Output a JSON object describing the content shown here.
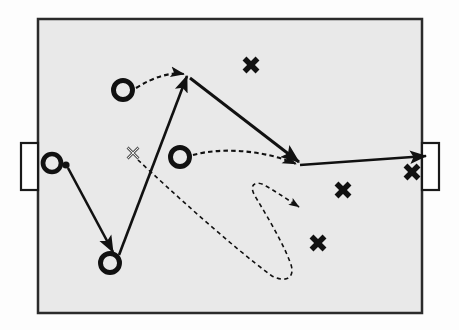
{
  "diagram": {
    "type": "sports-play-diagram",
    "colors": {
      "field_fill": "#e9e9e9",
      "field_border": "#2b2b2b",
      "outer_background": "#fdfdfd",
      "marker_stroke": "#111111",
      "run_path": "#111111",
      "pass_path": "#111111"
    },
    "field": {
      "label": "playing-field",
      "x": 38,
      "y": 19,
      "width": 384,
      "height": 294,
      "border_width": 2.5
    },
    "goals": [
      {
        "id": "goal-left",
        "label": "Left Goal",
        "x": 21,
        "y": 143,
        "width": 17,
        "height": 47
      },
      {
        "id": "goal-right",
        "label": "Right Goal",
        "x": 422,
        "y": 143,
        "width": 17,
        "height": 47
      }
    ],
    "markers": {
      "offense_label": "O",
      "defense_label": "X",
      "ball_label": "ball"
    },
    "players_offense": [
      {
        "id": "o-ball-carrier",
        "label": "O",
        "cx": 52,
        "cy": 163,
        "r": 9,
        "has_ball": true,
        "ball_cx": 66,
        "ball_cy": 165,
        "ball_r": 3.6
      },
      {
        "id": "o-top-left",
        "label": "O",
        "cx": 123,
        "cy": 90,
        "r": 9.5,
        "has_ball": false
      },
      {
        "id": "o-center",
        "label": "O",
        "cx": 180,
        "cy": 157,
        "r": 9.5,
        "has_ball": false
      },
      {
        "id": "o-bottom-left",
        "label": "O",
        "cx": 110,
        "cy": 263,
        "r": 9.5,
        "has_ball": false
      }
    ],
    "players_defense": [
      {
        "id": "x-top",
        "label": "X",
        "cx": 251,
        "cy": 65,
        "size": 13,
        "filled": true
      },
      {
        "id": "x-screen",
        "label": "X",
        "cx": 133,
        "cy": 153,
        "size": 11,
        "filled": false
      },
      {
        "id": "x-right-upper",
        "label": "X",
        "cx": 412,
        "cy": 172,
        "size": 13,
        "filled": true
      },
      {
        "id": "x-right-mid",
        "label": "X",
        "cx": 343,
        "cy": 190,
        "size": 13,
        "filled": true
      },
      {
        "id": "x-right-lower",
        "label": "X",
        "cx": 318,
        "cy": 243,
        "size": 13,
        "filled": true
      }
    ],
    "paths_solid": [
      {
        "id": "run-ballcarrier-to-bottomleft",
        "kind": "run",
        "description": "Ball carrier drives from left goal area down to bottom-left position",
        "d": "M 68 168 L 113 252",
        "arrowhead": true
      },
      {
        "id": "run-bottomleft-to-apex",
        "kind": "run",
        "description": "Bottom-left player runs up to the top apex point",
        "d": "M 119 255 L 187 76",
        "arrowhead": true
      },
      {
        "id": "run-apex-to-right",
        "kind": "run",
        "description": "From apex driving down-right to the right side convergence point",
        "d": "M 190 78 L 299 162",
        "arrowhead": true
      },
      {
        "id": "shot-to-right-goal",
        "kind": "shot",
        "description": "Shot from the right convergence point into the right goal",
        "d": "M 300 165 L 426 156",
        "arrowhead": true
      }
    ],
    "paths_dashed": [
      {
        "id": "pass-topleft-to-apex",
        "kind": "pass",
        "description": "Pass from top-left O curving right to the apex",
        "d": "M 136 88 C 155 76, 172 72, 184 74",
        "arrowhead": true
      },
      {
        "id": "pass-center-to-right",
        "kind": "pass",
        "description": "Pass from center O curving right to the convergence point",
        "d": "M 193 155 C 225 146, 270 152, 296 164",
        "arrowhead": true
      },
      {
        "id": "cut-screen-x-loop",
        "kind": "cut",
        "description": "Cut path from the hollow X looping around and back up to the right",
        "d": "M 138 160 C 170 190, 230 245, 272 276 C 288 284, 296 276, 290 262 C 282 240, 262 208, 255 196 C 248 184, 256 180, 266 186 C 278 193, 290 201, 299 207",
        "arrowhead": true
      }
    ],
    "annotations": []
  }
}
